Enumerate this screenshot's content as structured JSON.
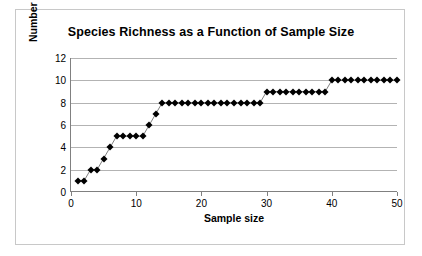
{
  "chart_data": {
    "type": "line",
    "title": "Species Richness as a Function of Sample Size",
    "xlabel": "Sample size",
    "ylabel": "Number of species",
    "xlim": [
      0,
      50
    ],
    "ylim": [
      0,
      12
    ],
    "xticks": [
      0,
      10,
      20,
      30,
      40,
      50
    ],
    "yticks": [
      0,
      2,
      4,
      6,
      8,
      10,
      12
    ],
    "grid": "horizontal",
    "legend": "none",
    "marker": "filled-diamond",
    "marker_color": "#000000",
    "line_color": "#808080",
    "x": [
      1,
      2,
      3,
      4,
      5,
      6,
      7,
      8,
      9,
      10,
      11,
      12,
      13,
      14,
      15,
      16,
      17,
      18,
      19,
      20,
      21,
      22,
      23,
      24,
      25,
      26,
      27,
      28,
      29,
      30,
      31,
      32,
      33,
      34,
      35,
      36,
      37,
      38,
      39,
      40,
      41,
      42,
      43,
      44,
      45,
      46,
      47,
      48,
      49,
      50
    ],
    "values": [
      1,
      1,
      2,
      2,
      3,
      4,
      5,
      5,
      5,
      5,
      5,
      6,
      7,
      8,
      8,
      8,
      8,
      8,
      8,
      8,
      8,
      8,
      8,
      8,
      8,
      8,
      8,
      8,
      8,
      9,
      9,
      9,
      9,
      9,
      9,
      9,
      9,
      9,
      9,
      10,
      10,
      10,
      10,
      10,
      10,
      10,
      10,
      10,
      10,
      10
    ]
  }
}
